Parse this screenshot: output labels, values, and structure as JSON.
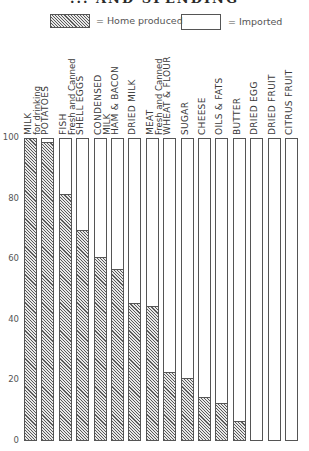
{
  "chart_data": {
    "type": "bar",
    "stacked": true,
    "title": "... AND SPENDING",
    "xlabel": "",
    "ylabel": "",
    "ylim": [
      0,
      100
    ],
    "yticks": [
      0,
      20,
      40,
      60,
      80,
      100
    ],
    "grid": false,
    "legend_position": "top",
    "categories": [
      "MILK for drinking",
      "POTATOES",
      "FISH Fresh and Canned",
      "SHELL EGGS",
      "CONDENSED MILK",
      "HAM & BACON",
      "DRIED MILK",
      "MEAT Fresh and Canned",
      "WHEAT & FLOUR",
      "SUGAR",
      "CHEESE",
      "OILS & FATS",
      "BUTTER",
      "DRIED EGG",
      "DRIED FRUIT",
      "CITRUS FRUIT"
    ],
    "series": [
      {
        "name": "Home produced",
        "values": [
          100,
          98,
          81,
          69,
          60,
          56,
          45,
          44,
          22,
          20,
          14,
          12,
          6,
          0,
          0,
          0
        ]
      },
      {
        "name": "Imported",
        "values": [
          0,
          2,
          19,
          31,
          40,
          44,
          55,
          56,
          78,
          80,
          86,
          88,
          94,
          100,
          100,
          100
        ]
      }
    ]
  },
  "title": "... AND SPENDING",
  "legend": {
    "home": "= Home produced",
    "imported": "= Imported"
  },
  "yticks": [
    "100",
    "80",
    "60",
    "40",
    "20",
    "0"
  ],
  "bars": [
    {
      "l1": "Milk",
      "l2": "for drinking",
      "home": 100
    },
    {
      "l1": "Potatoes",
      "l2": "",
      "home": 98
    },
    {
      "l1": "Fish",
      "l2": "Fresh and Canned",
      "home": 81
    },
    {
      "l1": "Shell Eggs",
      "l2": "",
      "home": 69
    },
    {
      "l1": "Condensed",
      "l2": "MILK",
      "home": 60
    },
    {
      "l1": "Ham & Bacon",
      "l2": "",
      "home": 56
    },
    {
      "l1": "Dried Milk",
      "l2": "",
      "home": 45
    },
    {
      "l1": "Meat",
      "l2": "Fresh and Canned",
      "home": 44
    },
    {
      "l1": "Wheat & Flour",
      "l2": "",
      "home": 22
    },
    {
      "l1": "Sugar",
      "l2": "",
      "home": 20
    },
    {
      "l1": "Cheese",
      "l2": "",
      "home": 14
    },
    {
      "l1": "Oils & Fats",
      "l2": "",
      "home": 12
    },
    {
      "l1": "Butter",
      "l2": "",
      "home": 6
    },
    {
      "l1": "Dried Egg",
      "l2": "",
      "home": 0
    },
    {
      "l1": "Dried Fruit",
      "l2": "",
      "home": 0
    },
    {
      "l1": "Citrus Fruit",
      "l2": "",
      "home": 0
    }
  ]
}
